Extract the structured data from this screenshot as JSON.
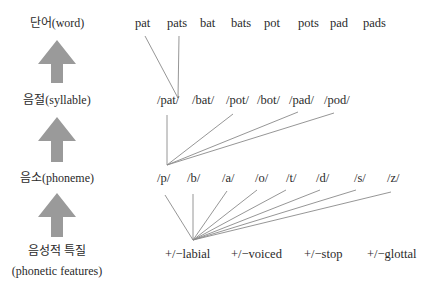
{
  "levels": [
    {
      "label": "단어(word)"
    },
    {
      "label": "음절(syllable)"
    },
    {
      "label": "음소(phoneme)"
    },
    {
      "label_line1": "음성적 특질",
      "label_line2": "(phonetic features)"
    }
  ],
  "words": [
    "pat",
    "pats",
    "bat",
    "bats",
    "pot",
    "pots",
    "pad",
    "pads"
  ],
  "syllables": [
    "/pat/",
    "/bat/",
    "/pot/",
    "/bot/",
    "/pad/",
    "/pod/"
  ],
  "phonemes": [
    "/p/",
    "/b/",
    "/a/",
    "/o/",
    "/t/",
    "/d/",
    "/s/",
    "/z/"
  ],
  "features": [
    "+/−labial",
    "+/−voiced",
    "+/−stop",
    "+/−glottal"
  ],
  "connections": {
    "word_to_syllable": [
      {
        "from": "pat",
        "to": "/pat/"
      },
      {
        "from": "pats",
        "to": "/pat/"
      }
    ],
    "syllable_to_phoneme": [
      {
        "from": "/pat/",
        "to": "/p/"
      },
      {
        "from": "/pot/",
        "to": "/p/"
      },
      {
        "from": "/pad/",
        "to": "/p/"
      },
      {
        "from": "/pod/",
        "to": "/p/"
      }
    ],
    "phoneme_to_feature": [
      {
        "from": "/p/",
        "to": "+/−labial"
      },
      {
        "from": "/b/",
        "to": "+/−labial"
      },
      {
        "from": "/a/",
        "to": "+/−labial"
      },
      {
        "from": "/o/",
        "to": "+/−labial"
      },
      {
        "from": "/t/",
        "to": "+/−labial"
      },
      {
        "from": "/d/",
        "to": "+/−labial"
      },
      {
        "from": "/s/",
        "to": "+/−labial"
      },
      {
        "from": "/z/",
        "to": "+/−labial"
      }
    ]
  },
  "colors": {
    "arrow": "#9a9a9a",
    "line": "#8a8a8a",
    "text": "#2a2a2a"
  }
}
